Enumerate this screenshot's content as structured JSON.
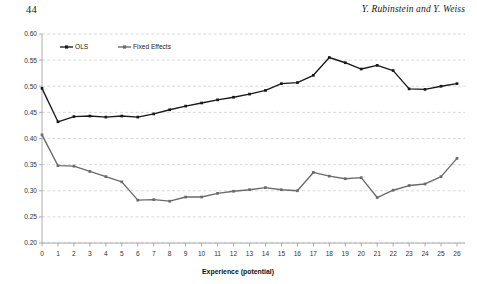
{
  "running_head": {
    "page_number": "44",
    "authors": "Y. Rubinstein and Y. Weiss"
  },
  "colors": {
    "ols": "#1a1a1a",
    "fixed_effects": "#6b6b6b",
    "gridline": "#c8c8c8",
    "axis": "#9a9a9a",
    "text": "#333333",
    "background": "#ffffff"
  },
  "chart_data": {
    "type": "line",
    "title": "",
    "xlabel": "Experience (potential)",
    "ylabel": "",
    "xlim": [
      0,
      26
    ],
    "ylim": [
      0.2,
      0.6
    ],
    "ytick_labels": [
      "0.60",
      "0.55",
      "0.50",
      "0.45",
      "0.40",
      "0.35",
      "0.30",
      "0.25",
      "0.20"
    ],
    "ytick_values": [
      0.6,
      0.55,
      0.5,
      0.45,
      0.4,
      0.35,
      0.3,
      0.25,
      0.2
    ],
    "xtick_labels": [
      "0",
      "1",
      "2",
      "3",
      "4",
      "5",
      "6",
      "7",
      "8",
      "9",
      "10",
      "11",
      "12",
      "13",
      "14",
      "15",
      "16",
      "17",
      "18",
      "19",
      "20",
      "21",
      "22",
      "23",
      "24",
      "25",
      "26"
    ],
    "x": [
      0,
      1,
      2,
      3,
      4,
      5,
      6,
      7,
      8,
      9,
      10,
      11,
      12,
      13,
      14,
      15,
      16,
      17,
      18,
      19,
      20,
      21,
      22,
      23,
      24,
      25,
      26
    ],
    "grid": "horizontal-dashed",
    "legend_position": "top-left-inside",
    "series": [
      {
        "name": "OLS",
        "color": "#1a1a1a",
        "marker": "square",
        "values": [
          0.496,
          0.432,
          0.442,
          0.443,
          0.441,
          0.443,
          0.441,
          0.447,
          0.455,
          0.462,
          0.468,
          0.474,
          0.479,
          0.485,
          0.492,
          0.505,
          0.507,
          0.521,
          0.555,
          0.545,
          0.533,
          0.54,
          0.53,
          0.495,
          0.494,
          0.5,
          0.505
        ],
        "values_note": "read from gridlines"
      },
      {
        "name": "Fixed Effects",
        "color": "#6b6b6b",
        "marker": "square",
        "values": [
          0.407,
          0.348,
          0.347,
          0.337,
          0.327,
          0.317,
          0.282,
          0.283,
          0.28,
          0.288,
          0.288,
          0.295,
          0.299,
          0.302,
          0.306,
          0.302,
          0.3,
          0.335,
          0.328,
          0.323,
          0.325,
          0.287,
          0.301,
          0.31,
          0.313,
          0.327,
          0.362
        ]
      }
    ]
  },
  "legend": {
    "items": [
      {
        "label": "OLS",
        "color": "#1a1a1a"
      },
      {
        "label": "Fixed Effects",
        "color": "#6b6b6b"
      }
    ]
  }
}
